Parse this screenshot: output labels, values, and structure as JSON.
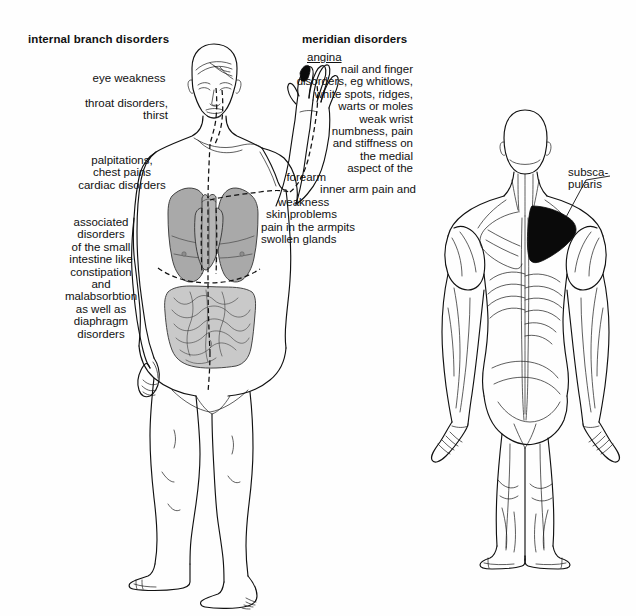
{
  "page": {
    "background_color": "#fefefe",
    "ink_color": "#111111",
    "lung_fill": "#a9a9a9",
    "intestine_fill": "#c9c9c9",
    "heart_fill": "#b5b5b5",
    "highlight_fill": "#0a0a0a"
  },
  "left_column": {
    "heading": "internal branch disorders",
    "groups": [
      {
        "name": "eye",
        "lines": [
          "eye weakness"
        ]
      },
      {
        "name": "throat",
        "lines": [
          "throat disorders,",
          "thirst"
        ]
      },
      {
        "name": "cardiac",
        "lines": [
          "palpitations,",
          "chest pains",
          "cardiac disorders"
        ]
      },
      {
        "name": "intestinal",
        "lines": [
          "associated",
          "disorders",
          "of the small",
          "intestine like",
          "constipation",
          "and",
          "malabsorbtion",
          "as well as",
          "diaphragm",
          "disorders"
        ]
      }
    ]
  },
  "right_column": {
    "heading": "meridian disorders",
    "first_term": "angina",
    "first_term_underlined": true,
    "lines": [
      "nail and finger",
      "disorders, eg whitlows,",
      "white spots, ridges,",
      "warts or moles",
      "weak wrist",
      "numbness, pain",
      "and stiffness on",
      "the medial",
      "aspect of the",
      "forearm",
      "inner arm pain and",
      "weakness",
      "skin problems",
      "pain in the armpits",
      "swollen glands"
    ]
  },
  "back_figure": {
    "label_lines": [
      "subsca-",
      "pularis"
    ],
    "highlighted_muscle": "subscapularis"
  },
  "figures": [
    {
      "name": "anterior-body-figure",
      "view": "front",
      "description": "standing male figure, left arm raised, showing lungs, heart and small intestine with dashed heart meridian pathway"
    },
    {
      "name": "posterior-muscle-figure",
      "view": "back",
      "description": "standing male figure seen from behind with superficial musculature, subscapularis region filled black"
    }
  ]
}
